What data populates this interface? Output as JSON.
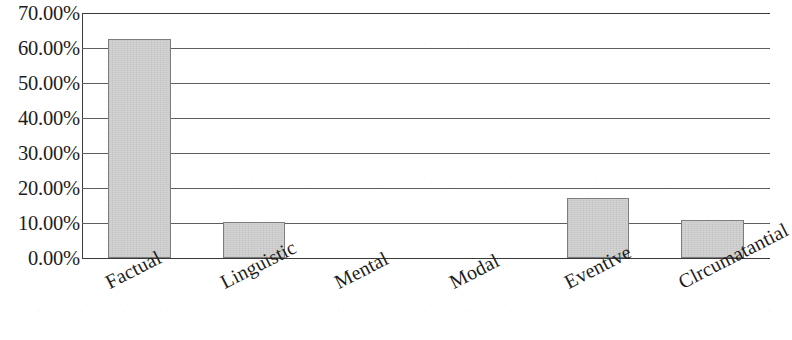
{
  "chart_data": {
    "type": "bar",
    "title": "",
    "subtitle": "",
    "xlabel": "",
    "ylabel": "",
    "categories": [
      "Factual",
      "Linguistic",
      "Mental",
      "Modal",
      "Eventive",
      "Clrcumatantial"
    ],
    "values": [
      62.5,
      10.4,
      0.0,
      0.0,
      17.1,
      11.0
    ],
    "series": [
      {
        "name": "",
        "values": [
          62.5,
          10.4,
          0.0,
          0.0,
          17.1,
          11.0
        ]
      }
    ],
    "ylim": [
      0,
      70
    ],
    "ytick_values": [
      0,
      10,
      20,
      30,
      40,
      50,
      60,
      70
    ],
    "ytick_labels": [
      "0.00%",
      "10.00%",
      "20.00%",
      "30.00%",
      "40.00%",
      "50.00%",
      "60.00%",
      "70.00%"
    ],
    "value_format": "percent",
    "grid": true,
    "grid_axis": "y",
    "legend": false,
    "legend_position": "none",
    "bar_fill_color": "#d2d2d2",
    "bar_border_color": "#7d7d7d",
    "gridline_color": "#5e5e5e",
    "axis_color": "#3a3a3a",
    "text_color": "#1d1d1d",
    "background_color": "#ffffff",
    "xtick_rotation_degrees": -27
  }
}
